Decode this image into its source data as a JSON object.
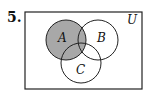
{
  "problem": {
    "number": "5."
  },
  "venn": {
    "universe_label": "U",
    "sets": [
      {
        "label": "A",
        "cx": 66,
        "cy": 40,
        "r": 20
      },
      {
        "label": "B",
        "cx": 98,
        "cy": 40,
        "r": 20
      },
      {
        "label": "C",
        "cx": 81,
        "cy": 63,
        "r": 20
      }
    ],
    "shaded_region": "A",
    "shade_color": "#a8a8a8",
    "stroke_color": "#222222"
  }
}
